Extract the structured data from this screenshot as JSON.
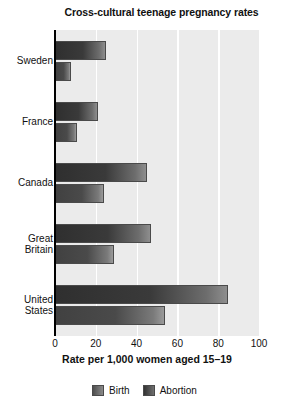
{
  "chart_data": {
    "type": "bar",
    "orientation": "horizontal",
    "title": "Cross-cultural teenage pregnancy rates",
    "xlabel": "Rate per 1,000 women aged 15–19",
    "ylabel": "",
    "categories": [
      "Sweden",
      "France",
      "Canada",
      "Great Britain",
      "United States"
    ],
    "series": [
      {
        "name": "Abortion",
        "values": [
          25,
          21,
          45,
          47,
          85
        ]
      },
      {
        "name": "Birth",
        "values": [
          8,
          11,
          24,
          29,
          54
        ]
      }
    ],
    "xlim": [
      0,
      100
    ],
    "xticks": [
      0,
      20,
      40,
      60,
      80,
      100
    ],
    "xtick_labels": [
      "0",
      "20",
      "40",
      "60",
      "80",
      "100"
    ],
    "grid": "vertical-white",
    "legend_position": "bottom-center",
    "legend_order": [
      "Birth",
      "Abortion"
    ],
    "colors": {
      "plot_background": "#ebebeb",
      "gridline": "#ffffff",
      "axis": "#000000",
      "abortion_bar": "#333333",
      "birth_bar": "#4e4e4e",
      "text": "#111111"
    }
  }
}
